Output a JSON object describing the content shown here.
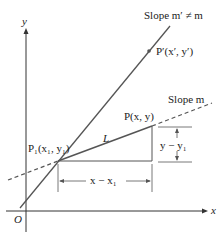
{
  "diagram": {
    "axes": {
      "x_label": "x",
      "y_label": "y",
      "origin_label": "O"
    },
    "lines": {
      "steep": {
        "label": "Slope m′ ≠ m"
      },
      "main": {
        "label": "Slope m",
        "name": "L"
      }
    },
    "points": {
      "p1": "P₁(x₁, y₁)",
      "p": "P(x,  y)",
      "p_prime": "P′(x′, y′)"
    },
    "dimensions": {
      "rise": "y − y₁",
      "run": "x − x₁"
    },
    "colors": {
      "line": "#555555",
      "axis": "#333333"
    }
  }
}
